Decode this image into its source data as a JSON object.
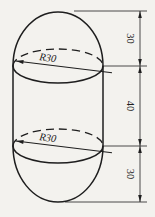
{
  "labels": {
    "radius_top": "R30",
    "radius_bottom": "R30",
    "dim_top": "30",
    "dim_middle": "40",
    "dim_bottom": "30"
  },
  "colors": {
    "line": "#1e1e1e",
    "paper": "#f3f2ee"
  }
}
